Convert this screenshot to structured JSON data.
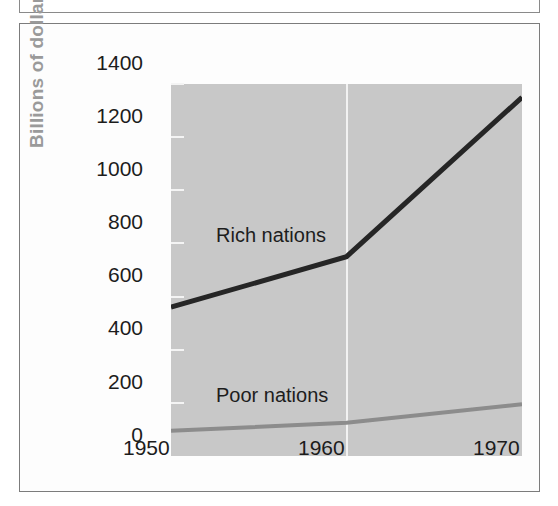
{
  "chart_data": {
    "type": "line",
    "title": "",
    "subtitle": "",
    "xlabel": "",
    "ylabel": "Billions of dollars",
    "xlim": [
      1950,
      1970
    ],
    "ylim": [
      0,
      1400
    ],
    "grid": "vertical gridline at 1960 only",
    "legend_position": "inline labels on plot",
    "x": [
      1950,
      1960,
      1970
    ],
    "categories": [
      "1950",
      "1960",
      "1970"
    ],
    "xticks": [
      "1950",
      "1960",
      "1970"
    ],
    "yticks": [
      "0",
      "200",
      "400",
      "600",
      "800",
      "1000",
      "1200",
      "1400"
    ],
    "ytick_values": [
      0,
      200,
      400,
      600,
      800,
      1000,
      1200,
      1400
    ],
    "series": [
      {
        "name": "Rich nations",
        "values": [
          560,
          750,
          1350
        ],
        "color": "#262626",
        "label_text": "Rich nations"
      },
      {
        "name": "Poor nations",
        "values": [
          95,
          125,
          195
        ],
        "color": "#8c8c8c",
        "label_text": "Poor nations"
      }
    ],
    "colors": {
      "plot_background": "#c8c8c8",
      "figure_background": "#fdfdfd",
      "frame_border": "#7c7c7c",
      "gridline": "#f2f2f2",
      "tick_mark": "#f4f4f4",
      "tick_label": "#1c1c1c",
      "axis_title": "#9a9a9a",
      "rich_nations_line": "#262626",
      "poor_nations_line": "#8c8c8c"
    }
  },
  "axis": {
    "y_title": "Billions of dollars",
    "y_labels": [
      "1400",
      "1200",
      "1000",
      "800",
      "600",
      "400",
      "200",
      "0"
    ],
    "x_labels": [
      "1950",
      "1960",
      "1970"
    ]
  },
  "labels": {
    "rich": "Rich nations",
    "poor": "Poor nations"
  }
}
